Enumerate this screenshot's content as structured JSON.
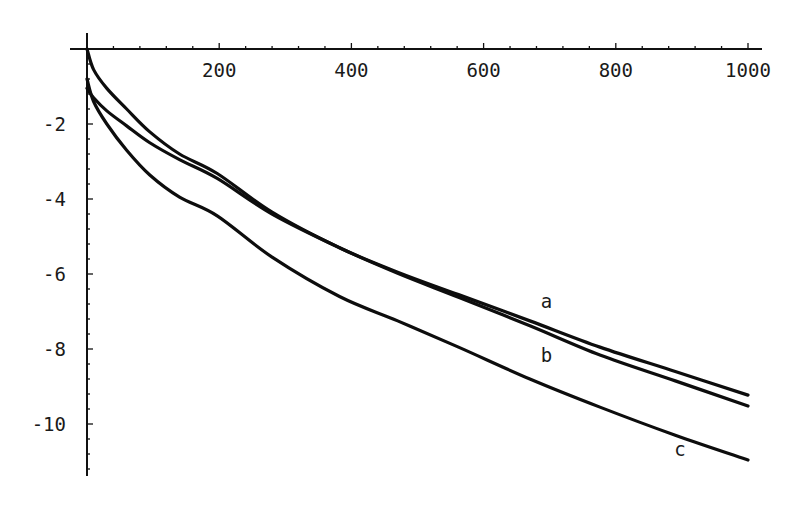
{
  "chart_data": {
    "type": "line",
    "title": "",
    "xlabel": "",
    "ylabel": "",
    "xlim": [
      0,
      1000
    ],
    "ylim": [
      -11.4,
      0
    ],
    "grid": false,
    "legend": "none (curves labeled inline)",
    "x_ticks": [
      {
        "value": 200,
        "label": "200"
      },
      {
        "value": 400,
        "label": "400"
      },
      {
        "value": 600,
        "label": "600"
      },
      {
        "value": 800,
        "label": "800"
      },
      {
        "value": 1000,
        "label": "1000"
      }
    ],
    "x_minor_step": 40,
    "y_ticks": [
      {
        "value": -2,
        "label": "-2"
      },
      {
        "value": -4,
        "label": "-4"
      },
      {
        "value": -6,
        "label": "-6"
      },
      {
        "value": -8,
        "label": "-8"
      },
      {
        "value": -10,
        "label": "-10"
      }
    ],
    "y_minor_step": 0.4,
    "x": [
      0,
      10,
      30,
      60,
      95,
      140,
      197,
      280,
      382,
      470,
      562,
      670,
      776,
      890,
      1000
    ],
    "series": [
      {
        "name": "a",
        "label": "a",
        "label_at": {
          "x": 695,
          "y": -6.9
        },
        "values": [
          0,
          -0.55,
          -1.05,
          -1.6,
          -2.21,
          -2.8,
          -3.32,
          -4.35,
          -5.3,
          -5.95,
          -6.55,
          -7.25,
          -7.95,
          -8.6,
          -9.23
        ]
      },
      {
        "name": "b",
        "label": "b",
        "label_at": {
          "x": 695,
          "y": -8.35
        },
        "values": [
          -1.05,
          -1.3,
          -1.65,
          -2.05,
          -2.5,
          -2.95,
          -3.45,
          -4.4,
          -5.3,
          -5.98,
          -6.62,
          -7.38,
          -8.16,
          -8.85,
          -9.52
        ]
      },
      {
        "name": "c",
        "label": "c",
        "label_at": {
          "x": 897,
          "y": -10.85
        },
        "values": [
          -0.8,
          -1.4,
          -2.0,
          -2.7,
          -3.36,
          -3.95,
          -4.45,
          -5.55,
          -6.6,
          -7.25,
          -7.95,
          -8.8,
          -9.55,
          -10.3,
          -10.96
        ]
      }
    ]
  }
}
